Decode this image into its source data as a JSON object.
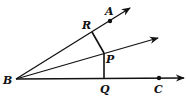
{
  "diagram": {
    "type": "geometry-angle-bisector",
    "stroke_color": "#111111",
    "background": "#ffffff",
    "points": {
      "B": {
        "label": "B",
        "x": 16,
        "y": 79
      },
      "A": {
        "label": "A",
        "x": 110,
        "y": 21
      },
      "R": {
        "label": "R",
        "x": 92,
        "y": 32
      },
      "P": {
        "label": "P",
        "x": 104,
        "y": 53
      },
      "Q": {
        "label": "Q",
        "x": 104,
        "y": 79
      },
      "C": {
        "label": "C",
        "x": 159,
        "y": 78
      }
    },
    "rays": [
      {
        "name": "BA",
        "from": "B",
        "end": [
          130,
          8
        ]
      },
      {
        "name": "bisector",
        "from": "B",
        "through": "P",
        "end": [
          158,
          38
        ]
      },
      {
        "name": "BC",
        "from": "B",
        "end": [
          184,
          78
        ]
      }
    ],
    "segments": [
      {
        "name": "PR",
        "from": "P",
        "to": "R"
      },
      {
        "name": "PQ",
        "from": "P",
        "to": "Q"
      }
    ]
  }
}
